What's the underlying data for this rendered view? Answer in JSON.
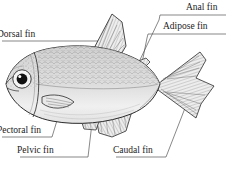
{
  "figure": {
    "style": "black-and-white stippled line engraving",
    "background_color": "#ffffff",
    "ink_color": "#1a1a1a",
    "cutoff_text_top": "············ ······· ········· ···········"
  },
  "labels": {
    "dorsal": "Dorsal fin",
    "anal": "Anal fin",
    "adipose": "Adipose fin",
    "pectoral": "Pectoral fin",
    "pelvic": "Pelvic fin",
    "caudal": "Caudal fin"
  },
  "parts": [
    {
      "id": "dorsal",
      "label": "Dorsal fin",
      "label_position": "top-left",
      "leader": "horizontal rule running right to a dot on the dorsal fin"
    },
    {
      "id": "anal",
      "label": "Anal fin",
      "label_position": "top-right",
      "leader": "rule running left then diagonally down-left to the anal fin"
    },
    {
      "id": "adipose",
      "label": "Adipose fin",
      "label_position": "upper-right",
      "leader": "rule running left then down to the small adipose fin"
    },
    {
      "id": "pectoral",
      "label": "Pectoral fin",
      "label_position": "bottom-left",
      "leader": "rule running right then up to the pectoral fin"
    },
    {
      "id": "pelvic",
      "label": "Pelvic fin",
      "label_position": "bottom-left",
      "leader": "rule running right then up-right to the pelvic fin"
    },
    {
      "id": "caudal",
      "label": "Caudal fin",
      "label_position": "bottom-right",
      "leader": "rule running right then up-right to the lower caudal lobe"
    }
  ]
}
